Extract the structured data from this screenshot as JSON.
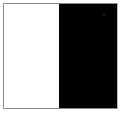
{
  "panel": {
    "left_color": "#ffffff",
    "right_color": "#000000",
    "border_color": "#8a8a8a"
  }
}
